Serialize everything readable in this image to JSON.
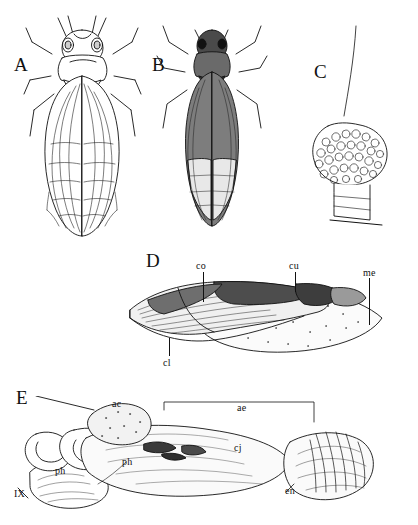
{
  "figure": {
    "caption_visible": false,
    "background": "#ffffff",
    "ink": "#111111"
  },
  "panels": [
    {
      "id": "A",
      "letter": "A",
      "name": "habitus-dorsal-adult",
      "x": 14,
      "y": 55
    },
    {
      "id": "B",
      "letter": "B",
      "name": "habitus-dorsal-second-specimen",
      "x": 152,
      "y": 55
    },
    {
      "id": "C",
      "letter": "C",
      "name": "head-lateral-detail",
      "x": 314,
      "y": 62
    },
    {
      "id": "D",
      "letter": "D",
      "name": "forewing-tegmen",
      "x": 146,
      "y": 251
    },
    {
      "id": "E",
      "letter": "E",
      "name": "male-genitalia-lateral",
      "x": 16,
      "y": 388
    }
  ],
  "labels": [
    {
      "text": "co",
      "name": "label-co",
      "x": 196,
      "y": 261
    },
    {
      "text": "cu",
      "name": "label-cu",
      "x": 289,
      "y": 261
    },
    {
      "text": "me",
      "name": "label-me",
      "x": 363,
      "y": 268
    },
    {
      "text": "cl",
      "name": "label-cl",
      "x": 163,
      "y": 358
    },
    {
      "text": "ac",
      "name": "label-ac",
      "x": 112,
      "y": 399
    },
    {
      "text": "ae",
      "name": "label-ae",
      "x": 237,
      "y": 403
    },
    {
      "text": "cj",
      "name": "label-cj",
      "x": 234,
      "y": 443
    },
    {
      "text": "ph",
      "name": "label-ph-upper",
      "x": 122,
      "y": 457
    },
    {
      "text": "ph",
      "name": "label-ph-lower",
      "x": 55,
      "y": 466
    },
    {
      "text": "en",
      "name": "label-en",
      "x": 285,
      "y": 486
    },
    {
      "text": "IX",
      "name": "label-ix",
      "x": 14,
      "y": 489
    }
  ]
}
